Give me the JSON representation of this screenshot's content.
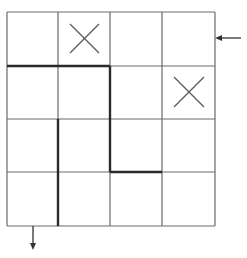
{
  "puzzle": {
    "rows": 4,
    "cols": 4,
    "grid_origin": [
      7,
      12
    ],
    "col_lines": [
      7,
      58,
      110,
      162,
      215
    ],
    "row_lines": [
      12,
      66,
      119,
      172,
      226
    ],
    "colors": {
      "grid_line": "#6a6a6a",
      "wall": "#2a2a2a",
      "mark": "#5a5a5a",
      "background": "#ffffff"
    },
    "x_marks": [
      {
        "row": 0,
        "col": 1
      },
      {
        "row": 1,
        "col": 3
      }
    ],
    "walls": [
      {
        "orientation": "horizontal",
        "y_line": 1,
        "from_col": 0,
        "to_col": 2
      },
      {
        "orientation": "vertical",
        "x_line": 2,
        "from_row": 1,
        "to_row": 3
      },
      {
        "orientation": "vertical",
        "x_line": 1,
        "from_row": 2,
        "to_row": 4
      },
      {
        "orientation": "horizontal",
        "y_line": 3,
        "from_col": 2,
        "to_col": 3
      }
    ],
    "entry_arrow": {
      "icon": "arrow-left-icon",
      "side": "right",
      "row": 0
    },
    "exit_arrow": {
      "icon": "arrow-down-icon",
      "side": "bottom",
      "col": 0
    }
  }
}
